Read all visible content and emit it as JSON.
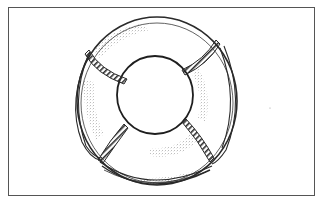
{
  "image": {
    "subject": "life buoy",
    "style": "pencil sketch",
    "alt_text": "Pencil sketch of a life ring with rope loops"
  },
  "colors": {
    "background": "#ffffff",
    "frame": "#555555",
    "ink": "#2a2a2a",
    "shading": "#8a8a8a"
  },
  "ring": {
    "outer": {
      "cx": 157,
      "cy": 101,
      "rx": 80,
      "ry": 84
    },
    "inner": {
      "cx": 155,
      "cy": 95,
      "rx": 38,
      "ry": 39
    },
    "straps": 4
  }
}
